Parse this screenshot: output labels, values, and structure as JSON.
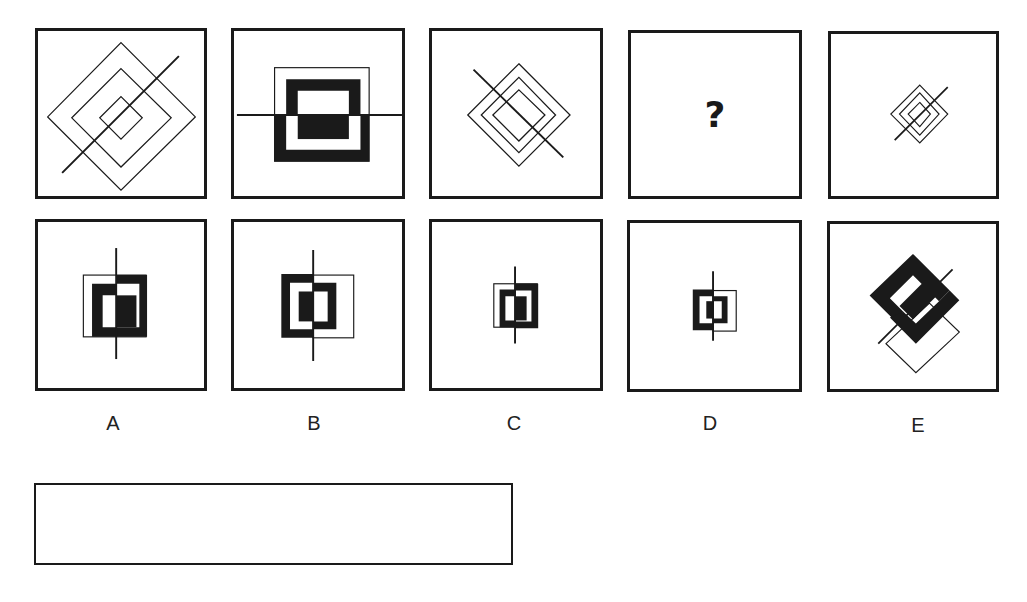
{
  "puzzle": {
    "question_row": [
      {
        "id": "q1",
        "figure": "nested-diamonds-3-with-diagonal-rising"
      },
      {
        "id": "q2",
        "figure": "offset-square-frames-with-horizontal-line"
      },
      {
        "id": "q3",
        "figure": "nested-diamonds-3-with-diagonal-falling"
      },
      {
        "id": "q4",
        "figure": "unknown",
        "text": "?"
      },
      {
        "id": "q5",
        "figure": "small-nested-diamonds-3-with-diagonal-rising"
      }
    ],
    "options": [
      {
        "label": "A",
        "figure": "offset-frames-vertical-line"
      },
      {
        "label": "B",
        "figure": "offset-frames-vertical-line-mirrored"
      },
      {
        "label": "C",
        "figure": "small-offset-frames-vertical-line"
      },
      {
        "label": "D",
        "figure": "small-offset-frames-vertical-line-mirrored"
      },
      {
        "label": "E",
        "figure": "rotated-offset-frames-diagonal-line"
      }
    ],
    "answer_box": {
      "value": ""
    }
  },
  "colors": {
    "stroke": "#1a1a1a",
    "background": "#ffffff"
  }
}
